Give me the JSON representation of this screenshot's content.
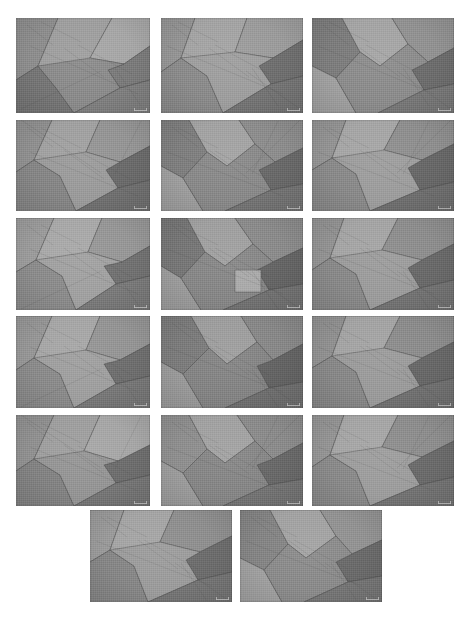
{
  "figure": {
    "type": "micrograph-panel",
    "kind": "grayscale grain-structure micrographs",
    "background_color": "#ffffff",
    "total_tiles": 17,
    "columns": 3,
    "rows": 6,
    "last_row_tiles": 2,
    "last_row_alignment": "center",
    "canvas": {
      "width": 470,
      "height": 619
    }
  },
  "palette": {
    "background": "#ffffff",
    "tone_darkest": "#5f5f5f",
    "tone_dark": "#6f6f6f",
    "tone_mid_dark": "#7d7d7d",
    "tone_mid": "#8b8b8b",
    "tone_mid_light": "#9a9a9a",
    "tone_light": "#a8a8a8",
    "tone_lightest": "#b6b6b6",
    "boundary_line": "#4a4a4a"
  },
  "watermark": {
    "label": "",
    "description": "faint light scale marker in lower-right of each micrograph"
  },
  "tiles": [
    {
      "id": "tile-1",
      "row": 1,
      "col": 1,
      "x": 16,
      "y": 18,
      "w": 134,
      "h": 95,
      "grains": [
        {
          "points": "0,0 42,0 22,48 0,62",
          "tone": "#8d8d8d"
        },
        {
          "points": "42,0 96,0 74,40 40,70 22,48",
          "tone": "#9e9e9e"
        },
        {
          "points": "96,0 134,0 134,28 108,46 74,40",
          "tone": "#a6a6a6"
        },
        {
          "points": "134,28 134,62 104,70 92,52 108,46",
          "tone": "#7a7a7a"
        },
        {
          "points": "0,62 22,48 40,70 58,95 0,95",
          "tone": "#757575"
        },
        {
          "points": "22,48 74,40 108,46 92,52 104,70 58,95 40,70",
          "tone": "#8a8a8a"
        },
        {
          "points": "104,70 134,62 134,95 58,95",
          "tone": "#7f7f7f"
        }
      ]
    },
    {
      "id": "tile-2",
      "row": 1,
      "col": 2,
      "x": 161,
      "y": 18,
      "w": 142,
      "h": 95,
      "grains": [
        {
          "points": "0,0 34,0 20,40 0,54",
          "tone": "#949494"
        },
        {
          "points": "34,0 86,0 74,34 46,58 20,40",
          "tone": "#a3a3a3"
        },
        {
          "points": "86,0 142,0 142,22 112,40 74,34",
          "tone": "#9b9b9b"
        },
        {
          "points": "142,22 142,58 110,66 98,48 112,40",
          "tone": "#6e6e6e"
        },
        {
          "points": "0,54 20,40 46,58 62,95 0,95",
          "tone": "#8a8a8a"
        },
        {
          "points": "20,40 74,34 112,40 98,48 110,66 62,95 46,58",
          "tone": "#9d9d9d"
        },
        {
          "points": "110,66 142,58 142,95 62,95",
          "tone": "#747474"
        }
      ]
    },
    {
      "id": "tile-3",
      "row": 1,
      "col": 3,
      "x": 312,
      "y": 18,
      "w": 142,
      "h": 95,
      "grains": [
        {
          "points": "0,0 30,0 48,34 24,60 0,48",
          "tone": "#7c7c7c"
        },
        {
          "points": "30,0 80,0 96,26 68,48 48,34",
          "tone": "#a4a4a4"
        },
        {
          "points": "80,0 142,0 142,30 116,44 96,26",
          "tone": "#919191"
        },
        {
          "points": "142,30 142,66 112,72 100,52 116,44",
          "tone": "#6c6c6c"
        },
        {
          "points": "0,48 24,60 44,95 0,95",
          "tone": "#a0a0a0"
        },
        {
          "points": "24,60 48,34 68,48 96,26 116,44 100,52 112,72 66,95 44,95",
          "tone": "#8b8b8b"
        },
        {
          "points": "112,72 142,66 142,95 66,95",
          "tone": "#787878"
        }
      ]
    },
    {
      "id": "tile-4",
      "row": 2,
      "col": 1,
      "x": 16,
      "y": 120,
      "w": 134,
      "h": 91,
      "grains": [
        {
          "points": "0,0 36,0 18,40 0,52",
          "tone": "#8f8f8f"
        },
        {
          "points": "36,0 84,0 70,32 44,56 18,40",
          "tone": "#a0a0a0"
        },
        {
          "points": "84,0 134,0 134,26 104,42 70,32",
          "tone": "#949494"
        },
        {
          "points": "134,26 134,60 102,68 90,50 104,42",
          "tone": "#6a6a6a"
        },
        {
          "points": "0,52 18,40 44,56 60,91 0,91",
          "tone": "#858585"
        },
        {
          "points": "18,40 70,32 104,42 90,50 102,68 60,91 44,56",
          "tone": "#9a9a9a"
        },
        {
          "points": "102,68 134,60 134,91 60,91",
          "tone": "#707070"
        }
      ]
    },
    {
      "id": "tile-5",
      "row": 2,
      "col": 2,
      "x": 161,
      "y": 120,
      "w": 142,
      "h": 91,
      "grains": [
        {
          "points": "0,0 28,0 46,32 22,58 0,46",
          "tone": "#7e7e7e"
        },
        {
          "points": "28,0 78,0 94,24 66,46 46,32",
          "tone": "#a2a2a2"
        },
        {
          "points": "78,0 142,0 142,28 114,42 94,24",
          "tone": "#8c8c8c"
        },
        {
          "points": "142,28 142,64 110,70 98,50 114,42",
          "tone": "#686868"
        },
        {
          "points": "0,46 22,58 42,91 0,91",
          "tone": "#9e9e9e"
        },
        {
          "points": "22,58 46,32 66,46 94,24 114,42 98,50 110,70 64,91 42,91",
          "tone": "#888888"
        },
        {
          "points": "110,70 142,64 142,91 64,91",
          "tone": "#747474"
        }
      ]
    },
    {
      "id": "tile-6",
      "row": 2,
      "col": 3,
      "x": 312,
      "y": 120,
      "w": 142,
      "h": 91,
      "grains": [
        {
          "points": "0,0 34,0 20,38 0,50",
          "tone": "#939393"
        },
        {
          "points": "34,0 88,0 72,30 44,54 20,38",
          "tone": "#a5a5a5"
        },
        {
          "points": "88,0 142,0 142,24 110,40 72,30",
          "tone": "#8e8e8e"
        },
        {
          "points": "142,24 142,62 108,70 96,48 110,40",
          "tone": "#676767"
        },
        {
          "points": "0,50 20,38 44,54 58,91 0,91",
          "tone": "#898989"
        },
        {
          "points": "20,38 72,30 110,40 96,48 108,70 58,91 44,54",
          "tone": "#9c9c9c"
        },
        {
          "points": "108,70 142,62 142,91 58,91",
          "tone": "#6f6f6f"
        }
      ]
    },
    {
      "id": "tile-7",
      "row": 3,
      "col": 1,
      "x": 16,
      "y": 218,
      "w": 134,
      "h": 92,
      "grains": [
        {
          "points": "0,0 38,0 20,42 0,54",
          "tone": "#9b9b9b"
        },
        {
          "points": "38,0 86,0 72,34 46,58 20,42",
          "tone": "#a8a8a8"
        },
        {
          "points": "86,0 134,0 134,28 106,44 72,34",
          "tone": "#969696"
        },
        {
          "points": "134,28 134,58 100,66 88,48 106,44",
          "tone": "#717171"
        },
        {
          "points": "0,54 20,42 46,58 60,92 0,92",
          "tone": "#8b8b8b"
        },
        {
          "points": "20,42 72,34 106,44 88,48 100,66 60,92 46,58",
          "tone": "#a0a0a0"
        },
        {
          "points": "100,66 134,58 134,92 60,92",
          "tone": "#7a7a7a"
        }
      ]
    },
    {
      "id": "tile-8",
      "row": 3,
      "col": 2,
      "x": 161,
      "y": 218,
      "w": 142,
      "h": 92,
      "grains": [
        {
          "points": "0,0 26,0 44,34 20,60 0,48",
          "tone": "#767676"
        },
        {
          "points": "26,0 74,0 92,26 64,48 44,34",
          "tone": "#9f9f9f"
        },
        {
          "points": "74,0 142,0 142,30 112,44 92,26",
          "tone": "#8a8a8a"
        },
        {
          "points": "142,30 142,66 108,72 96,52 112,44",
          "tone": "#646464"
        },
        {
          "points": "0,48 20,60 40,92 0,92",
          "tone": "#9c9c9c"
        },
        {
          "points": "20,60 44,34 64,48 92,26 112,44 96,52 108,72 62,92 40,92",
          "tone": "#868686"
        },
        {
          "points": "108,72 142,66 142,92 62,92",
          "tone": "#727272"
        },
        {
          "points": "74,52 100,52 100,74 74,74",
          "tone": "#a9a9a9"
        }
      ]
    },
    {
      "id": "tile-9",
      "row": 3,
      "col": 3,
      "x": 312,
      "y": 218,
      "w": 142,
      "h": 92,
      "grains": [
        {
          "points": "0,0 32,0 18,40 0,52",
          "tone": "#929292"
        },
        {
          "points": "32,0 86,0 70,32 44,56 18,40",
          "tone": "#a4a4a4"
        },
        {
          "points": "86,0 142,0 142,26 110,42 70,32",
          "tone": "#8d8d8d"
        },
        {
          "points": "142,26 142,62 108,70 96,50 110,42",
          "tone": "#696969"
        },
        {
          "points": "0,52 18,40 44,56 58,92 0,92",
          "tone": "#888888"
        },
        {
          "points": "18,40 70,32 110,42 96,50 108,70 58,92 44,56",
          "tone": "#9b9b9b"
        },
        {
          "points": "108,70 142,62 142,92 58,92",
          "tone": "#737373"
        }
      ]
    },
    {
      "id": "tile-10",
      "row": 4,
      "col": 1,
      "x": 16,
      "y": 316,
      "w": 134,
      "h": 92,
      "grains": [
        {
          "points": "0,0 36,0 18,42 0,54",
          "tone": "#969696"
        },
        {
          "points": "36,0 84,0 70,34 44,58 18,42",
          "tone": "#a6a6a6"
        },
        {
          "points": "84,0 134,0 134,28 104,44 70,34",
          "tone": "#949494"
        },
        {
          "points": "134,28 134,60 100,68 88,48 104,44",
          "tone": "#6e6e6e"
        },
        {
          "points": "0,54 18,42 44,58 58,92 0,92",
          "tone": "#8a8a8a"
        },
        {
          "points": "18,42 70,34 104,44 88,48 100,68 58,92 44,58",
          "tone": "#9e9e9e"
        },
        {
          "points": "100,68 134,60 134,92 58,92",
          "tone": "#787878"
        }
      ]
    },
    {
      "id": "tile-11",
      "row": 4,
      "col": 2,
      "x": 161,
      "y": 316,
      "w": 142,
      "h": 92,
      "grains": [
        {
          "points": "0,0 30,0 48,32 22,58 0,46",
          "tone": "#7b7b7b"
        },
        {
          "points": "30,0 80,0 96,26 66,48 48,32",
          "tone": "#9d9d9d"
        },
        {
          "points": "80,0 142,0 142,28 112,44 96,26",
          "tone": "#878787"
        },
        {
          "points": "142,28 142,66 108,72 96,50 112,44",
          "tone": "#636363"
        },
        {
          "points": "0,46 22,58 42,92 0,92",
          "tone": "#9a9a9a"
        },
        {
          "points": "22,58 48,32 66,48 96,26 112,44 96,50 108,72 64,92 42,92",
          "tone": "#838383"
        },
        {
          "points": "108,72 142,66 142,92 64,92",
          "tone": "#6f6f6f"
        }
      ]
    },
    {
      "id": "tile-12",
      "row": 4,
      "col": 3,
      "x": 312,
      "y": 316,
      "w": 142,
      "h": 92,
      "grains": [
        {
          "points": "0,0 34,0 20,40 0,52",
          "tone": "#909090"
        },
        {
          "points": "34,0 88,0 72,32 44,56 20,40",
          "tone": "#a3a3a3"
        },
        {
          "points": "88,0 142,0 142,26 110,42 72,32",
          "tone": "#8b8b8b"
        },
        {
          "points": "142,26 142,62 108,70 96,50 110,42",
          "tone": "#676767"
        },
        {
          "points": "0,52 20,40 44,56 58,92 0,92",
          "tone": "#878787"
        },
        {
          "points": "20,40 72,32 110,42 96,50 108,70 58,92 44,56",
          "tone": "#9a9a9a"
        },
        {
          "points": "108,70 142,62 142,92 58,92",
          "tone": "#717171"
        }
      ]
    },
    {
      "id": "tile-13",
      "row": 5,
      "col": 1,
      "x": 16,
      "y": 415,
      "w": 134,
      "h": 91,
      "grains": [
        {
          "points": "0,0 38,0 18,44 0,56",
          "tone": "#909090"
        },
        {
          "points": "38,0 84,0 68,36 44,60 18,44",
          "tone": "#9e9e9e"
        },
        {
          "points": "84,0 134,0 134,30 102,46 68,36",
          "tone": "#a6a6a6"
        },
        {
          "points": "134,30 134,60 100,68 88,50 102,46",
          "tone": "#6d6d6d"
        },
        {
          "points": "0,56 18,44 44,60 58,91 0,91",
          "tone": "#828282"
        },
        {
          "points": "18,44 68,36 102,46 88,50 100,68 58,91 44,60",
          "tone": "#949494"
        },
        {
          "points": "100,68 134,60 134,91 58,91",
          "tone": "#767676"
        }
      ]
    },
    {
      "id": "tile-14",
      "row": 5,
      "col": 2,
      "x": 161,
      "y": 415,
      "w": 142,
      "h": 91,
      "grains": [
        {
          "points": "0,0 28,0 46,34 22,58 0,46",
          "tone": "#8e8e8e"
        },
        {
          "points": "28,0 76,0 94,26 64,48 46,34",
          "tone": "#a1a1a1"
        },
        {
          "points": "76,0 142,0 142,28 112,44 94,26",
          "tone": "#8a8a8a"
        },
        {
          "points": "142,28 142,64 108,70 96,50 112,44",
          "tone": "#686868"
        },
        {
          "points": "0,46 22,58 42,91 0,91",
          "tone": "#9c9c9c"
        },
        {
          "points": "22,58 46,34 64,48 94,26 112,44 96,50 108,70 62,91 42,91",
          "tone": "#858585"
        },
        {
          "points": "108,70 142,64 142,91 62,91",
          "tone": "#747474"
        }
      ]
    },
    {
      "id": "tile-15",
      "row": 5,
      "col": 3,
      "x": 312,
      "y": 415,
      "w": 142,
      "h": 91,
      "grains": [
        {
          "points": "0,0 32,0 18,40 0,52",
          "tone": "#949494"
        },
        {
          "points": "32,0 86,0 70,32 44,56 18,40",
          "tone": "#a5a5a5"
        },
        {
          "points": "86,0 142,0 142,26 110,42 70,32",
          "tone": "#8d8d8d"
        },
        {
          "points": "142,26 142,62 108,70 96,50 110,42",
          "tone": "#6a6a6a"
        },
        {
          "points": "0,52 18,40 44,56 58,91 0,91",
          "tone": "#898989"
        },
        {
          "points": "18,40 70,32 110,42 96,50 108,70 58,91 44,56",
          "tone": "#9c9c9c"
        },
        {
          "points": "108,70 142,62 142,91 58,91",
          "tone": "#737373"
        }
      ]
    },
    {
      "id": "tile-16",
      "row": 6,
      "col": 1,
      "x": 90,
      "y": 510,
      "w": 142,
      "h": 92,
      "grains": [
        {
          "points": "0,0 34,0 20,40 0,52",
          "tone": "#9a9a9a"
        },
        {
          "points": "34,0 84,0 70,32 44,56 20,40",
          "tone": "#a4a4a4"
        },
        {
          "points": "84,0 142,0 142,26 110,42 70,32",
          "tone": "#8e8e8e"
        },
        {
          "points": "142,26 142,62 108,70 96,50 110,42",
          "tone": "#6c6c6c"
        },
        {
          "points": "0,52 20,40 44,56 58,92 0,92",
          "tone": "#868686"
        },
        {
          "points": "20,40 70,32 110,42 96,50 108,70 58,92 44,56",
          "tone": "#9b9b9b"
        },
        {
          "points": "108,70 142,62 142,92 58,92",
          "tone": "#757575"
        }
      ]
    },
    {
      "id": "tile-17",
      "row": 6,
      "col": 2,
      "x": 240,
      "y": 510,
      "w": 142,
      "h": 92,
      "grains": [
        {
          "points": "0,0 30,0 48,34 24,60 0,48",
          "tone": "#848484"
        },
        {
          "points": "30,0 80,0 96,26 66,48 48,34",
          "tone": "#a2a2a2"
        },
        {
          "points": "80,0 142,0 142,30 112,44 96,26",
          "tone": "#929292"
        },
        {
          "points": "142,30 142,66 108,72 96,52 112,44",
          "tone": "#6a6a6a"
        },
        {
          "points": "0,48 24,60 42,92 0,92",
          "tone": "#a0a0a0"
        },
        {
          "points": "24,60 48,34 66,48 96,26 112,44 96,52 108,72 64,92 42,92",
          "tone": "#8a8a8a"
        },
        {
          "points": "108,72 142,66 142,92 64,92",
          "tone": "#767676"
        }
      ]
    }
  ]
}
